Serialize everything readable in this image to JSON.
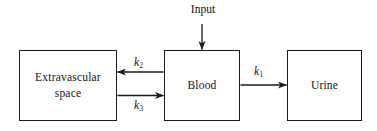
{
  "diagram": {
    "background_color": "#ffffff",
    "line_color": "#1a1a1a",
    "text_color": "#111111",
    "nodes": [
      {
        "id": "extravascular",
        "label_line1": "Extravascular",
        "label_line2": "space",
        "shape": "rectangle"
      },
      {
        "id": "blood",
        "label": "Blood",
        "shape": "rectangle"
      },
      {
        "id": "urine",
        "label": "Urine",
        "shape": "rectangle"
      }
    ],
    "external_labels": {
      "input": "Input"
    },
    "edges": [
      {
        "id": "k2",
        "from": "blood",
        "to": "extravascular",
        "label_symbol": "k",
        "label_subscript": "2",
        "direction": "leftward"
      },
      {
        "id": "k3",
        "from": "extravascular",
        "to": "blood",
        "label_symbol": "k",
        "label_subscript": "3",
        "direction": "rightward"
      },
      {
        "id": "k1",
        "from": "blood",
        "to": "urine",
        "label_symbol": "k",
        "label_subscript": "1",
        "direction": "rightward"
      },
      {
        "id": "input-arrow",
        "from": "input",
        "to": "blood",
        "label_symbol": "",
        "label_subscript": "",
        "direction": "downward"
      }
    ]
  }
}
